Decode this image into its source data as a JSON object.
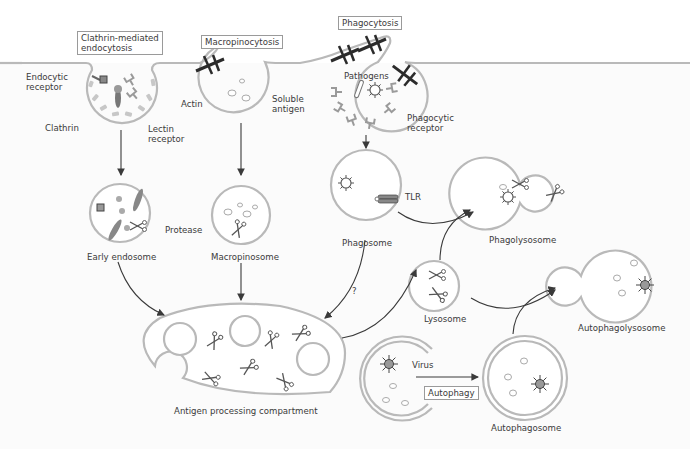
{
  "diagram": {
    "title_boxes": {
      "clathrin": "Clathrin-mediated\nendocytosis",
      "clathrin_line1": "Clathrin-mediated",
      "clathrin_line2": "endocytosis",
      "macropinocytosis": "Macropinocytosis",
      "phagocytosis": "Phagocytosis",
      "autophagy": "Autophagy"
    },
    "labels": {
      "endocytic_receptor_1": "Endocytic",
      "endocytic_receptor_2": "receptor",
      "clathrin": "Clathrin",
      "lectin_receptor_1": "Lectin",
      "lectin_receptor_2": "receptor",
      "actin": "Actin",
      "soluble_antigen_1": "Soluble",
      "soluble_antigen_2": "antigen",
      "pathogens": "Pathogens",
      "phagocytic_receptor_1": "Phagocytic",
      "phagocytic_receptor_2": "receptor",
      "protease": "Protease",
      "early_endosome": "Early endosome",
      "macropinosome": "Macropinosome",
      "tlr": "TLR",
      "phagosome": "Phagosome",
      "phagolysosome": "Phagolysosome",
      "question": "?",
      "lysosome": "Lysosome",
      "autophagolysosome": "Autophagolysosome",
      "antigen_processing_compartment": "Antigen processing compartment",
      "virus": "Virus",
      "autophagosome": "Autophagosome"
    },
    "colors": {
      "membrane": "#b9b9b9",
      "arrow": "#3a3a3a",
      "actin": "#2b2b2b",
      "text": "#3a3a3a",
      "extracellular_bg": "#ffffff",
      "cytoplasm_bg": "#fafafa"
    }
  }
}
